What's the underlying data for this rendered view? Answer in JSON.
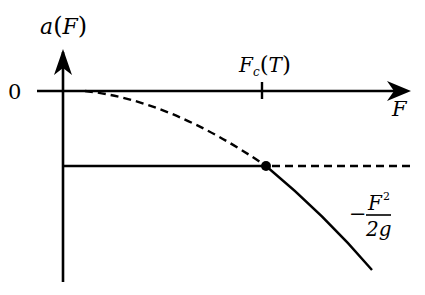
{
  "diagram": {
    "y_axis_label": {
      "base": "a",
      "open": "(",
      "arg": "F",
      "close": ")"
    },
    "x_axis_label": "F",
    "origin_label": "0",
    "tick_label": {
      "base": "F",
      "sub": "c",
      "open": "(",
      "arg": "T",
      "close": ")"
    },
    "curve_label": {
      "sign": "−",
      "numerator": "F",
      "numerator_exp": "2",
      "denominator": "2g"
    },
    "colors": {
      "line": "#000000",
      "background": "#ffffff"
    }
  }
}
